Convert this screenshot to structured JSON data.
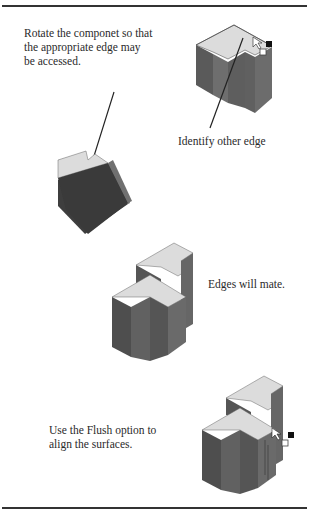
{
  "page": {
    "captions": {
      "rotate": "Rotate the componet so that the appropriate edge may be accessed.",
      "identify": "Identify other edge",
      "mate": "Edges will mate.",
      "flush": "Use the Flush option to align the surfaces."
    },
    "colors": {
      "top_face": "#dcdcdc",
      "left_face": "#555555",
      "right_face": "#6a6a6a",
      "rule": "#333333"
    }
  }
}
